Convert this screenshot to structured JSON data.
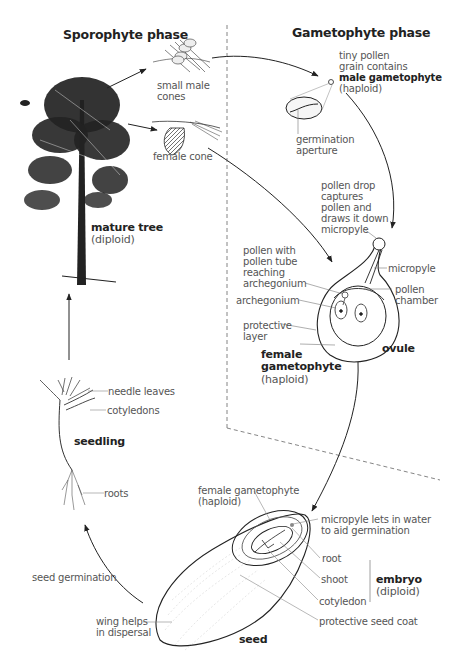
{
  "top_fragment": "Life cycle of a pine",
  "phases": {
    "sporophyte": "Sporophyte phase",
    "gametophyte": "Gametophyte phase"
  },
  "labels": {
    "small_male_cones": "small male\ncones",
    "female_cone": "female cone",
    "mature_tree": "mature tree",
    "mature_tree_ploidy": "(diploid)",
    "pollen_line1": "tiny pollen\ngrain contains",
    "male_gametophyte": "male gametophyte",
    "male_gametophyte_ploidy": "(haploid)",
    "germination_aperture": "germination\naperture",
    "pollen_drop": "pollen drop\ncaptures\npollen and\ndraws it down\nmicropyle",
    "pollen_tube": "pollen with\npollen tube\nreaching\narchegonium",
    "micropyle": "micropyle",
    "pollen_chamber": "pollen\nchamber",
    "archegonium": "archegonium",
    "protective_layer": "protective\nlayer",
    "ovule": "ovule",
    "female_gametophyte": "female\ngametophyte",
    "female_gametophyte_ploidy": "(haploid)",
    "needle_leaves": "needle leaves",
    "cotyledons": "cotyledons",
    "seedling": "seedling",
    "roots": "roots",
    "seed_female_gametophyte": "female gametophyte\n(haploid)",
    "micropyle_water": "micropyle lets in water\nto aid germination",
    "root": "root",
    "shoot": "shoot",
    "cotyledon": "cotyledon",
    "embryo": "embryo",
    "embryo_ploidy": "(diploid)",
    "protective_seed_coat": "protective seed coat",
    "seed_germination": "seed germination",
    "wing": "wing helps\nin dispersal",
    "seed": "seed"
  },
  "colors": {
    "ink": "#222222",
    "leader": "#777777",
    "text": "#555555",
    "divider": "#666666"
  }
}
